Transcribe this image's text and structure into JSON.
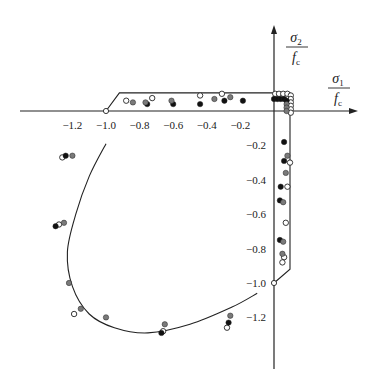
{
  "chart_data": {
    "type": "scatter",
    "title": "",
    "xlabel": "σ1 / fc",
    "ylabel": "σ2 / fc",
    "axis_labels": {
      "x": {
        "num": "σ",
        "sub": "1",
        "den": "f",
        "den_sub": "c"
      },
      "y": {
        "num": "σ",
        "sub": "2",
        "den": "f",
        "den_sub": "c"
      }
    },
    "xlim": [
      -1.5,
      0.5
    ],
    "ylim": [
      -1.5,
      0.5
    ],
    "grid": false,
    "legend": null,
    "x_ticks": [
      {
        "value": -1.2,
        "label": "-1.2"
      },
      {
        "value": -1.0,
        "label": "-1.0"
      },
      {
        "value": -0.8,
        "label": "-0.8"
      },
      {
        "value": -0.6,
        "label": "-0.6"
      },
      {
        "value": -0.4,
        "label": "-0.4"
      },
      {
        "value": -0.2,
        "label": "-0.2"
      }
    ],
    "y_ticks": [
      {
        "value": -0.2,
        "label": "-0.2"
      },
      {
        "value": -0.4,
        "label": "-0.4"
      },
      {
        "value": -0.6,
        "label": "-0.6"
      },
      {
        "value": -0.8,
        "label": "-0.8"
      },
      {
        "value": -1.0,
        "label": "-1.0"
      },
      {
        "value": -1.2,
        "label": "-1.2"
      }
    ],
    "failure_envelope": {
      "tension_box": [
        [
          -0.92,
          0.105
        ],
        [
          0.095,
          0.105
        ],
        [
          0.095,
          -0.92
        ],
        [
          0.0,
          -1.0
        ]
      ],
      "tension_box_left_diag": [
        [
          -1.0,
          0.0
        ],
        [
          -0.92,
          0.105
        ]
      ],
      "compression_curve": [
        [
          -1.0,
          -0.19
        ],
        [
          -1.1,
          -0.38
        ],
        [
          -1.18,
          -0.6
        ],
        [
          -1.23,
          -0.82
        ],
        [
          -1.2,
          -1.02
        ],
        [
          -1.1,
          -1.18
        ],
        [
          -0.95,
          -1.26
        ],
        [
          -0.75,
          -1.29
        ],
        [
          -0.5,
          -1.24
        ],
        [
          -0.25,
          -1.14
        ],
        [
          -0.1,
          -1.06
        ]
      ]
    },
    "series": [
      {
        "name": "open",
        "marker": "open-circle",
        "color": "#ffffff",
        "points": [
          [
            -0.88,
            0.06
          ],
          [
            -0.725,
            0.075
          ],
          [
            -0.44,
            0.09
          ],
          [
            -0.31,
            0.1
          ],
          [
            0.007,
            0.1
          ],
          [
            0.03,
            0.1
          ],
          [
            0.055,
            0.1
          ],
          [
            0.08,
            0.1
          ],
          [
            0.1,
            0.09
          ],
          [
            0.1,
            0.07
          ],
          [
            0.1,
            0.05
          ],
          [
            0.1,
            0.03
          ],
          [
            0.1,
            0.01
          ],
          [
            0.1,
            -0.01
          ],
          [
            0.095,
            -0.3
          ],
          [
            0.08,
            -0.44
          ],
          [
            0.07,
            -0.65
          ],
          [
            0.06,
            -0.85
          ],
          [
            0.05,
            -0.88
          ],
          [
            -1.26,
            -0.27
          ],
          [
            -1.28,
            -0.66
          ],
          [
            -1.19,
            -1.18
          ],
          [
            -0.66,
            -1.28
          ],
          [
            -0.28,
            -1.26
          ]
        ]
      },
      {
        "name": "black",
        "marker": "filled-circle",
        "color": "#111111",
        "points": [
          [
            -0.755,
            0.04
          ],
          [
            -0.6,
            0.04
          ],
          [
            -0.44,
            0.04
          ],
          [
            -0.295,
            0.06
          ],
          [
            -0.185,
            0.06
          ],
          [
            0.0,
            0.07
          ],
          [
            0.02,
            0.07
          ],
          [
            0.04,
            0.07
          ],
          [
            0.06,
            0.07
          ],
          [
            0.075,
            0.06
          ],
          [
            0.06,
            -0.18
          ],
          [
            0.06,
            -0.29
          ],
          [
            0.04,
            -0.44
          ],
          [
            0.035,
            -0.52
          ],
          [
            0.035,
            -0.75
          ],
          [
            -1.24,
            -0.26
          ],
          [
            -1.3,
            -0.67
          ],
          [
            -0.67,
            -1.29
          ],
          [
            -0.27,
            -1.23
          ]
        ]
      },
      {
        "name": "gray",
        "marker": "filled-circle",
        "color": "#7a7a7a",
        "points": [
          [
            -0.84,
            0.05
          ],
          [
            -0.765,
            0.05
          ],
          [
            -0.61,
            0.06
          ],
          [
            -0.355,
            0.07
          ],
          [
            -0.26,
            0.08
          ],
          [
            0.075,
            0.04
          ],
          [
            0.075,
            0.02
          ],
          [
            0.075,
            0.0
          ],
          [
            0.08,
            -0.26
          ],
          [
            0.07,
            -0.36
          ],
          [
            0.055,
            -0.53
          ],
          [
            0.055,
            -0.76
          ],
          [
            0.05,
            -0.83
          ],
          [
            -1.2,
            -0.26
          ],
          [
            -1.25,
            -0.65
          ],
          [
            -1.22,
            -1.0
          ],
          [
            -1.15,
            -1.15
          ],
          [
            -1.0,
            -1.2
          ],
          [
            -0.65,
            -1.24
          ],
          [
            -0.26,
            -1.19
          ]
        ]
      }
    ]
  },
  "plot_geometry": {
    "origin_px": [
      274,
      111
    ],
    "x_scale": 168,
    "y_scale": 172,
    "x_axis_px": [
      20,
      358
    ],
    "y_axis_px": [
      25,
      369
    ]
  }
}
